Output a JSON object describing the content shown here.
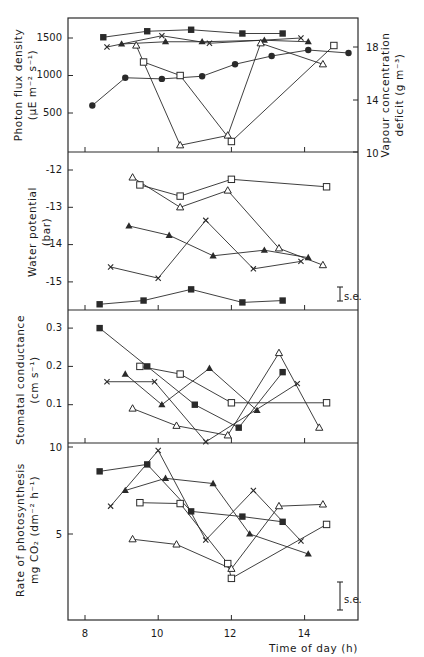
{
  "figure": {
    "x_axis_label": "Time of day (h)",
    "x_ticks": [
      "8",
      "10",
      "12",
      "14"
    ],
    "se_label": "s.e.",
    "colors": {
      "ink": "#2a2a2a",
      "background": "#ffffff"
    }
  },
  "panels": [
    {
      "id": "photon",
      "ylabel_line1": "Photon flux density",
      "ylabel_line2": "(µE m⁻² s⁻¹)",
      "yticks": [
        "1500",
        "1000",
        "500"
      ],
      "right_ylabel_line1": "Vapour concentration",
      "right_ylabel_line2": "deficit  (g m⁻³)",
      "right_yticks": [
        "18",
        "14",
        "10"
      ]
    },
    {
      "id": "water",
      "ylabel_line1": "Water potential",
      "ylabel_line2": "(bar)",
      "yticks": [
        "-12",
        "-13",
        "-14",
        "-15"
      ]
    },
    {
      "id": "stomatal",
      "ylabel_line1": "Stomatal conductance",
      "ylabel_line2": "(cm s⁻¹)",
      "yticks": [
        "0.3",
        "0.2",
        "0.1"
      ]
    },
    {
      "id": "photosynthesis",
      "ylabel_line1": "Rate of photosynthesis",
      "ylabel_line2": "mg CO₂  (dm⁻² h⁻¹)",
      "yticks": [
        "10",
        "5"
      ]
    }
  ],
  "chart_data": [
    {
      "type": "line",
      "title": "Photon flux density / Vapour concentration deficit",
      "xlabel": "Time of day (h)",
      "ylabel": "Photon flux density (µE m-2 s-1)",
      "y2label": "Vapour concentration deficit (g m-3)",
      "xlim": [
        7.5,
        15.4
      ],
      "ylim": [
        0,
        1750
      ],
      "y2lim": [
        10,
        19.5
      ],
      "series": [
        {
          "name": "filled-square",
          "marker": "filled-square",
          "x": [
            8.5,
            9.7,
            10.9,
            12.3,
            13.4
          ],
          "y": [
            1510,
            1590,
            1610,
            1560,
            1560
          ]
        },
        {
          "name": "cross",
          "marker": "cross",
          "x": [
            8.6,
            10.1,
            11.4,
            13.9
          ],
          "y": [
            1380,
            1530,
            1430,
            1500
          ]
        },
        {
          "name": "filled-triangle",
          "marker": "filled-triangle",
          "x": [
            9.0,
            10.2,
            11.2,
            12.9,
            14.1
          ],
          "y": [
            1420,
            1450,
            1450,
            1470,
            1450
          ]
        },
        {
          "name": "open-triangle",
          "marker": "open-triangle",
          "x": [
            9.4,
            10.6,
            11.9,
            12.8,
            14.5
          ],
          "y": [
            1400,
            70,
            200,
            1430,
            1150
          ]
        },
        {
          "name": "open-square",
          "marker": "open-square",
          "x": [
            9.6,
            10.6,
            12.0,
            14.8
          ],
          "y": [
            1180,
            1000,
            120,
            1400
          ]
        },
        {
          "name": "filled-circle",
          "marker": "filled-circle",
          "x": [
            8.2,
            9.1,
            10.1,
            11.2,
            12.1,
            13.1,
            14.1,
            15.2
          ],
          "y": [
            600,
            970,
            955,
            990,
            1150,
            1260,
            1340,
            1300
          ]
        }
      ]
    },
    {
      "type": "line",
      "title": "Water potential",
      "xlabel": "Time of day (h)",
      "ylabel": "Water potential (bar)",
      "xlim": [
        7.5,
        15.4
      ],
      "ylim": [
        -15.75,
        -11.5
      ],
      "series": [
        {
          "name": "open-triangle",
          "marker": "open-triangle",
          "x": [
            9.3,
            10.6,
            11.9,
            13.3,
            14.5
          ],
          "y": [
            -12.2,
            -13.0,
            -12.55,
            -14.1,
            -14.55
          ]
        },
        {
          "name": "open-square",
          "marker": "open-square",
          "x": [
            9.5,
            10.6,
            12.0,
            14.6
          ],
          "y": [
            -12.4,
            -12.7,
            -12.25,
            -12.45
          ]
        },
        {
          "name": "filled-triangle",
          "marker": "filled-triangle",
          "x": [
            9.2,
            10.3,
            11.5,
            12.9,
            14.1
          ],
          "y": [
            -13.5,
            -13.75,
            -14.3,
            -14.15,
            -14.35
          ]
        },
        {
          "name": "cross",
          "marker": "cross",
          "x": [
            8.7,
            10.0,
            11.3,
            12.6,
            13.9
          ],
          "y": [
            -14.6,
            -14.9,
            -13.35,
            -14.65,
            -14.45
          ]
        },
        {
          "name": "filled-square",
          "marker": "filled-square",
          "x": [
            8.4,
            9.6,
            10.9,
            12.3,
            13.4
          ],
          "y": [
            -15.6,
            -15.5,
            -15.2,
            -15.55,
            -15.5
          ]
        }
      ]
    },
    {
      "type": "line",
      "title": "Stomatal conductance",
      "xlabel": "Time of day (h)",
      "ylabel": "Stomatal conductance (cm s-1)",
      "xlim": [
        7.5,
        15.4
      ],
      "ylim": [
        0,
        0.34
      ],
      "series": [
        {
          "name": "filled-square",
          "marker": "filled-square",
          "x": [
            8.4,
            9.7,
            11.0,
            12.2,
            13.4
          ],
          "y": [
            0.3,
            0.2,
            0.1,
            0.04,
            0.185
          ]
        },
        {
          "name": "open-square",
          "marker": "open-square",
          "x": [
            9.5,
            10.6,
            12.0,
            14.6
          ],
          "y": [
            0.2,
            0.18,
            0.105,
            0.105
          ]
        },
        {
          "name": "filled-triangle",
          "marker": "filled-triangle",
          "x": [
            9.1,
            10.1,
            11.4,
            12.7
          ],
          "y": [
            0.18,
            0.1,
            0.195,
            0.085
          ]
        },
        {
          "name": "cross",
          "marker": "cross",
          "x": [
            8.6,
            9.9,
            11.3,
            13.8
          ],
          "y": [
            0.16,
            0.16,
            0.003,
            0.155
          ]
        },
        {
          "name": "open-triangle",
          "marker": "open-triangle",
          "x": [
            9.3,
            10.5,
            11.9,
            13.3,
            14.4
          ],
          "y": [
            0.09,
            0.045,
            0.02,
            0.235,
            0.04
          ]
        }
      ]
    },
    {
      "type": "line",
      "title": "Rate of photosynthesis",
      "xlabel": "Time of day (h)",
      "ylabel": "Rate of photosynthesis mg CO2 (dm-2 h-1)",
      "xlim": [
        7.5,
        15.4
      ],
      "ylim": [
        0,
        10.2
      ],
      "series": [
        {
          "name": "filled-square",
          "marker": "filled-square",
          "x": [
            8.4,
            9.7,
            10.9,
            12.3,
            13.4
          ],
          "y": [
            8.6,
            9.0,
            6.3,
            6.0,
            5.7
          ]
        },
        {
          "name": "cross",
          "marker": "cross",
          "x": [
            8.7,
            10.0,
            11.3,
            12.6,
            13.9
          ],
          "y": [
            6.6,
            9.8,
            4.65,
            7.5,
            4.6
          ]
        },
        {
          "name": "filled-triangle",
          "marker": "filled-triangle",
          "x": [
            9.1,
            10.2,
            11.5,
            12.5,
            14.1
          ],
          "y": [
            7.5,
            8.2,
            7.9,
            5.0,
            3.85
          ]
        },
        {
          "name": "open-square",
          "marker": "open-square",
          "x": [
            9.5,
            10.6,
            11.9,
            12.0,
            14.6
          ],
          "y": [
            6.8,
            6.75,
            3.3,
            2.45,
            5.55
          ]
        },
        {
          "name": "open-triangle",
          "marker": "open-triangle",
          "x": [
            9.3,
            10.5,
            12.0,
            13.3,
            14.5
          ],
          "y": [
            4.7,
            4.4,
            3.0,
            6.6,
            6.7
          ]
        }
      ]
    }
  ]
}
